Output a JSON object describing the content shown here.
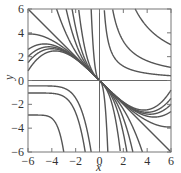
{
  "chart_data": {
    "type": "line",
    "title": "",
    "xlabel": "x",
    "ylabel": "y",
    "xlim": [
      -6,
      6
    ],
    "ylim": [
      -6,
      6
    ],
    "grid": false,
    "legend": null,
    "xticks": [
      -6,
      -4,
      -2,
      0,
      2,
      4,
      6
    ],
    "yticks": [
      -6,
      -4,
      -2,
      0,
      2,
      4,
      6
    ],
    "xtick_labels": [
      "−6",
      "−4",
      "−2",
      "0",
      "2",
      "4",
      "6"
    ],
    "ytick_labels": [
      "−6",
      "−4",
      "−2",
      "0",
      "2",
      "4",
      "6"
    ],
    "axes_lines": {
      "x_axis_y": 0,
      "y_axis_x": 0
    },
    "series": [
      {
        "name": "line y=-x",
        "kind": "line",
        "points": [
          [
            -6,
            6
          ],
          [
            6,
            -6
          ]
        ]
      },
      {
        "name": "fan top-intercepts (x at y=6, mirrored)",
        "kind": "fan_top",
        "x_intercepts": [
          -3.6,
          -2.8,
          -2.3,
          -1.75,
          -0.7
        ]
      },
      {
        "name": "fan left-intercepts (y at x=-6, mirrored)",
        "kind": "fan_left",
        "y_intercepts": [
          3.9,
          2.6,
          2.0,
          1.5,
          0.8
        ]
      },
      {
        "name": "quadrant I hyperbolas xy=c",
        "kind": "hyperbola",
        "c_values": [
          2.4,
          6.6,
          18
        ]
      },
      {
        "name": "quadrant III curves",
        "kind": "q3_curves",
        "curves": [
          {
            "left_y": -0.45,
            "bottom_x": -0.7
          },
          {
            "left_y": -1.05,
            "bottom_x": -1.2
          },
          {
            "left_y": -2.9,
            "bottom_x": -3.0
          }
        ]
      }
    ]
  },
  "axes": {
    "xlabel": "x",
    "ylabel": "y"
  }
}
